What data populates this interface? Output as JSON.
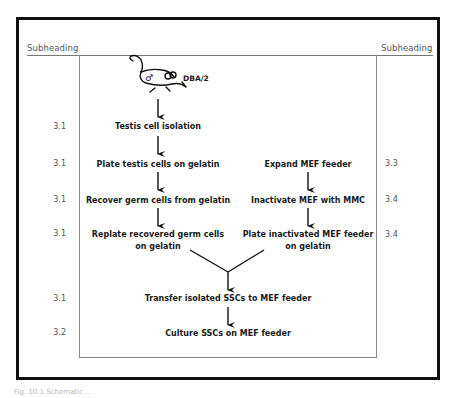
{
  "diagram": {
    "subheadings": {
      "left": "Subheading",
      "right": "Subheading"
    },
    "mouse": {
      "label": "DBA/2",
      "symbol": "♂",
      "icon": "mouse-icon"
    },
    "left_column": [
      {
        "step": "3.1",
        "label": "Testis cell isolation"
      },
      {
        "step": "3.1",
        "label": "Plate testis cells on gelatin"
      },
      {
        "step": "3.1",
        "label": "Recover germ cells from gelatin"
      },
      {
        "step": "3.1",
        "label_line1": "Replate recovered germ cells",
        "label_line2": "on gelatin"
      }
    ],
    "right_column": [
      {
        "step": "3.3",
        "label": "Expand MEF feeder"
      },
      {
        "step": "3.4",
        "label": "Inactivate MEF with MMC"
      },
      {
        "step": "3.4",
        "label_line1": "Plate inactivated MEF feeder",
        "label_line2": "on gelatin"
      }
    ],
    "merged": [
      {
        "step": "3.1",
        "label": "Transfer isolated SSCs to MEF feeder"
      },
      {
        "step": "3.2",
        "label": "Culture SSCs on MEF feeder"
      }
    ],
    "caption": "Fig. 10.1 Schematic ..."
  }
}
